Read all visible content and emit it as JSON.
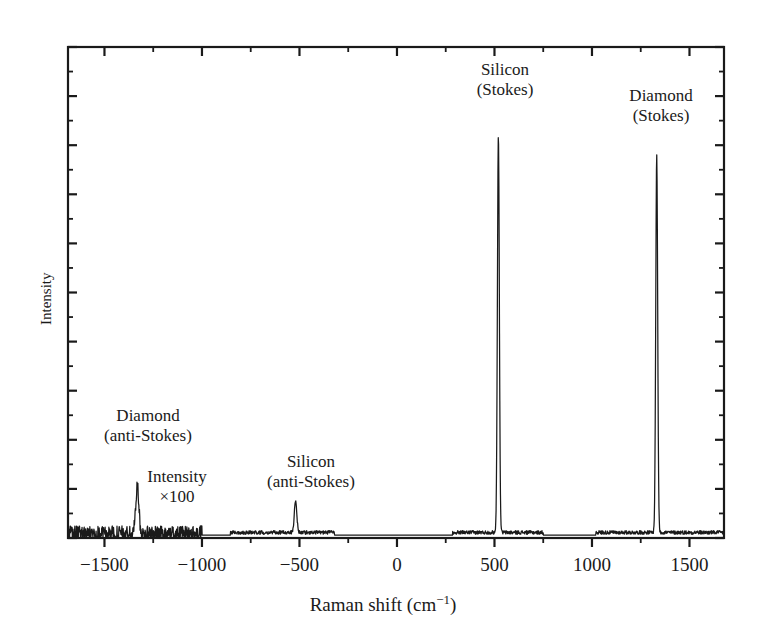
{
  "chart_data": {
    "type": "line",
    "title": "",
    "xlabel": "Raman shift (cm−1)",
    "ylabel": "Intensity",
    "xlim": [
      -1687,
      1677
    ],
    "ylim": [
      0,
      1.06
    ],
    "grid": false,
    "legend": "none",
    "x_ticks": [
      -1500,
      -1000,
      -500,
      0,
      500,
      1000,
      1500
    ],
    "x_tick_labels": [
      "−1500",
      "−1000",
      "−500",
      "0",
      "500",
      "1000",
      "1500"
    ],
    "x_minor_ticks": [
      -1750,
      -1250,
      -750,
      -250,
      250,
      750,
      1250,
      1750
    ],
    "y_ticks_unlabeled": true,
    "y_major_tick_count": 10,
    "y_minor_tick_count": 10,
    "line_color": "#1a1a1a",
    "annotations": [
      {
        "id": "diamond-anti-stokes",
        "line1": "Diamond",
        "line2": "(anti-Stokes)",
        "x_center": 148,
        "y_top": 406
      },
      {
        "id": "intensity-x100",
        "line1": "Intensity",
        "line2": "×100",
        "x_center": 177,
        "y_top": 467
      },
      {
        "id": "silicon-anti-stokes",
        "line1": "Silicon",
        "line2": "(anti-Stokes)",
        "x_center": 311,
        "y_top": 452
      },
      {
        "id": "silicon-stokes",
        "line1": "Silicon",
        "line2": "(Stokes)",
        "x_center": 505,
        "y_top": 60
      },
      {
        "id": "diamond-stokes",
        "line1": "Diamond",
        "line2": "(Stokes)",
        "x_center": 661,
        "y_top": 86
      }
    ],
    "peaks": [
      {
        "name": "Diamond (anti-Stokes)",
        "shift": -1332,
        "relative_intensity": 0.105,
        "scaled_x100": true,
        "width": 11
      },
      {
        "name": "Silicon (anti-Stokes)",
        "shift": -520,
        "relative_intensity": 0.068,
        "scaled_x100": true,
        "width": 9
      },
      {
        "name": "Silicon (Stokes)",
        "shift": 520,
        "relative_intensity": 0.86,
        "scaled_x100": false,
        "width": 7
      },
      {
        "name": "Diamond (Stokes)",
        "shift": 1332,
        "relative_intensity": 0.815,
        "scaled_x100": false,
        "width": 7
      }
    ],
    "segments": [
      {
        "name": "noisy-anti-stokes-diamond",
        "x_start": -1687,
        "x_end": -1000,
        "noise": 0.016,
        "baseline": 0.01
      },
      {
        "name": "silicon-anti-stokes-band",
        "x_start": -855,
        "x_end": -320,
        "noise": 0.004,
        "baseline": 0.012
      },
      {
        "name": "silicon-stokes-band",
        "x_start": 285,
        "x_end": 750,
        "noise": 0.004,
        "baseline": 0.012
      },
      {
        "name": "diamond-stokes-band",
        "x_start": 1020,
        "x_end": 1677,
        "noise": 0.004,
        "baseline": 0.012
      }
    ]
  },
  "axes": {
    "x_title": "Raman shift (cm−1)",
    "x_title_main": "Raman shift (cm",
    "x_title_sup": "−1",
    "x_title_tail": ")",
    "y_title": "Intensity"
  }
}
